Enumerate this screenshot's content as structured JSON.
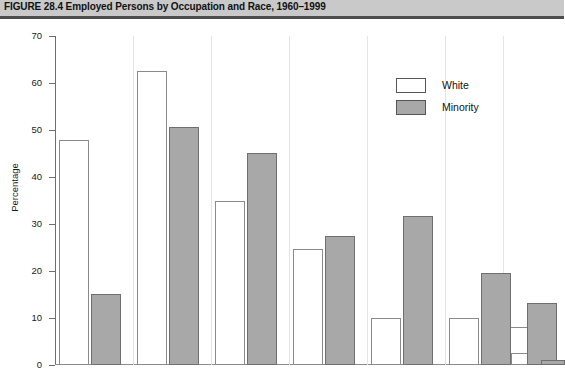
{
  "figure": {
    "label": "FIGURE 28.4",
    "title": "Employed Persons by Occupation and Race, 1960–1999",
    "full_title": "FIGURE 28.4  Employed Persons by Occupation and Race, 1960–1999"
  },
  "legend": {
    "position": "top-right",
    "entries": [
      {
        "label": "White",
        "color": "#ffffff"
      },
      {
        "label": "Minority",
        "color": "#a8a8a8"
      }
    ]
  },
  "axis": {
    "y_title": "Percentage",
    "y_ticks": [
      "0",
      "10",
      "20",
      "30",
      "40",
      "50",
      "60",
      "70"
    ],
    "y_min": 0,
    "y_max": 70,
    "y_step": 10,
    "x_ticks": []
  },
  "colors": {
    "white_bar_fill": "#ffffff",
    "white_bar_stroke": "#8a8a8a",
    "minority_bar_fill": "#a8a8a8",
    "minority_bar_stroke": "#6f6f6f",
    "header_band": "#c9c9c9",
    "header_rule": "#4d4d4d",
    "axis": "#6e6e6e"
  },
  "chart_data": {
    "type": "bar",
    "title": "Employed Persons by Occupation and Race, 1960–1999",
    "xlabel": "",
    "ylabel": "Percentage",
    "ylim": [
      0,
      70
    ],
    "ytick_step": 10,
    "grid": false,
    "legend_position": "top-right",
    "categories": [
      "1",
      "2",
      "3",
      "4",
      "5",
      "6"
    ],
    "series": [
      {
        "name": "White",
        "values": [
          47.8,
          62.6,
          34.8,
          24.7,
          9.9,
          8.1
        ]
      },
      {
        "name": "Minority",
        "values": [
          15.1,
          50.7,
          45.1,
          27.5,
          31.8,
          13.3
        ]
      }
    ],
    "extra_pair": {
      "white": 2.5,
      "minority": 1.0
    }
  },
  "bars": [
    {
      "series": "White",
      "value": 47.8,
      "x": 4,
      "w": 30
    },
    {
      "series": "Minority",
      "value": 15.1,
      "x": 36,
      "w": 30
    },
    {
      "series": "White",
      "value": 62.6,
      "x": 82,
      "w": 30
    },
    {
      "series": "Minority",
      "value": 50.7,
      "x": 114,
      "w": 30
    },
    {
      "series": "White",
      "value": 34.8,
      "x": 160,
      "w": 30
    },
    {
      "series": "Minority",
      "value": 45.1,
      "x": 192,
      "w": 30
    },
    {
      "series": "White",
      "value": 24.7,
      "x": 238,
      "w": 30
    },
    {
      "series": "Minority",
      "value": 27.5,
      "x": 270,
      "w": 30
    },
    {
      "series": "White",
      "value": 9.9,
      "x": 316,
      "w": 30
    },
    {
      "series": "Minority",
      "value": 31.8,
      "x": 348,
      "w": 30
    },
    {
      "series": "White",
      "value": 9.9,
      "x": 394,
      "w": 30
    },
    {
      "series": "Minority",
      "value": 19.6,
      "x": 426,
      "w": 30
    },
    {
      "series": "White",
      "value": 8.1,
      "x": 452,
      "w": 30
    },
    {
      "series": "Minority",
      "value": 13.3,
      "x": 472,
      "w": 30
    },
    {
      "series": "White",
      "value": 2.5,
      "x": 456,
      "w": 30
    },
    {
      "series": "Minority",
      "value": 1.0,
      "x": 486,
      "w": 24
    }
  ]
}
